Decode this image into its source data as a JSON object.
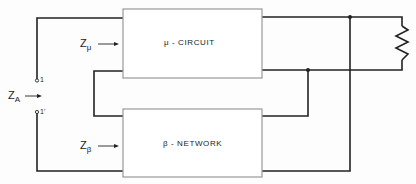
{
  "diagram": {
    "type": "feedback-amplifier-block-diagram",
    "blocks": {
      "mu_circuit": {
        "label": "μ - CIRCUIT"
      },
      "beta_network": {
        "label": "β - NETWORK"
      }
    },
    "impedances": {
      "z_mu": {
        "main": "Z",
        "sub": "μ"
      },
      "z_beta": {
        "main": "Z",
        "sub": "β"
      },
      "z_a": {
        "main": "Z",
        "sub": "A"
      }
    },
    "terminals": {
      "t1": "1",
      "t1_prime": "1'"
    },
    "components": [
      "load-resistor"
    ],
    "colors": {
      "wire": "#222222",
      "box_border": "#999999",
      "background": "#fdfdfd"
    }
  }
}
